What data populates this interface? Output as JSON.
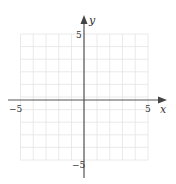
{
  "chart_data": {
    "type": "grid",
    "title": "",
    "xlabel": "x",
    "ylabel": "y",
    "xlim": [
      -5,
      5
    ],
    "ylim": [
      -5,
      5
    ],
    "grid": true,
    "grid_step": 1,
    "tick_labels": {
      "x": [
        {
          "value": -5,
          "label": "−5"
        },
        {
          "value": 5,
          "label": "5"
        }
      ],
      "y": [
        {
          "value": 5,
          "label": "5"
        },
        {
          "value": -5,
          "label": "−5"
        }
      ]
    },
    "series": []
  },
  "colors": {
    "grid": "#e4e4e4",
    "axis": "#555555",
    "text": "#333333"
  }
}
